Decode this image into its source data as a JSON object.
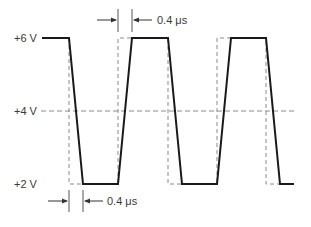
{
  "diagram": {
    "title": "",
    "voltage_labels": {
      "high": "+6 V",
      "mid": "+4 V",
      "low": "+2 V"
    },
    "annotations": {
      "fall_time": "0.4 μs",
      "rise_time": "0.4 μs"
    },
    "levels_v": {
      "high": 6,
      "threshold": 4,
      "low": 2
    },
    "transition_time_us": 0.4,
    "colors": {
      "waveform": "#1a1a1a",
      "ideal": "#8a8a8a",
      "text": "#3a3a3a"
    }
  }
}
